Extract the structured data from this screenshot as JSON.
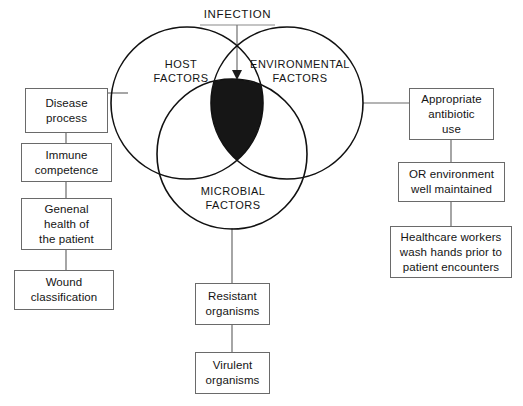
{
  "diagram": {
    "title_label": "INFECTION",
    "venn_circles": [
      {
        "id": "host",
        "label": "HOST\nFACTORS",
        "cx": 187,
        "cy": 103,
        "r": 76
      },
      {
        "id": "environmental",
        "label": "ENVIRONMENTAL\nFACTORS",
        "cx": 287,
        "cy": 103,
        "r": 76
      },
      {
        "id": "microbial",
        "label": "MICROBIAL\nFACTORS",
        "cx": 232,
        "cy": 154,
        "r": 75
      }
    ],
    "intersection_fill": "#161616",
    "line_color": "#6a6a6a",
    "circle_stroke": "#111111",
    "left_branch": [
      {
        "id": "disease-process",
        "label": "Disease\nprocess"
      },
      {
        "id": "immune-competence",
        "label": "Immune\ncompetence"
      },
      {
        "id": "general-health",
        "label": "Genenal\nhealth of\nthe patient"
      },
      {
        "id": "wound-classification",
        "label": "Wound\nclassification"
      }
    ],
    "right_branch": [
      {
        "id": "appropriate-antibiotic-use",
        "label": "Appropriate\nantibiotic\nuse"
      },
      {
        "id": "or-environment",
        "label": "OR environment\nwell maintained"
      },
      {
        "id": "healthcare-workers-wash-hands",
        "label": "Healthcare workers\nwash hands prior to\npatient encounters"
      }
    ],
    "bottom_branch": [
      {
        "id": "resistant-organisms",
        "label": "Resistant\norganisms"
      },
      {
        "id": "virulent-organisms",
        "label": "Virulent\norganisms"
      }
    ]
  }
}
